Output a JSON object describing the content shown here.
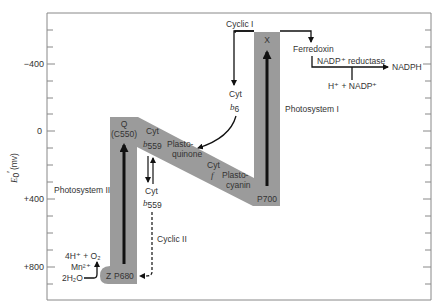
{
  "diagram": {
    "type": "Z-scheme of photosynthetic electron transport",
    "band_color": "#9b9b9b",
    "axis": {
      "label_main": "E",
      "label_sub": "0",
      "label_prime": "′",
      "label_unit": "(mv)",
      "ticks": [
        {
          "label": "−400",
          "value": -400
        },
        {
          "label": "0",
          "value": 0
        },
        {
          "label": "+400",
          "value": 400
        },
        {
          "label": "+800",
          "value": 800
        }
      ]
    },
    "labels": {
      "cyclic1": "Cyclic I",
      "x": "X",
      "ferredoxin": "Ferredoxin",
      "nadp_reductase": "NADP⁺ reductase",
      "nadph": "NADPH",
      "h_nadp": "H⁺ + NADP⁺",
      "cyt": "Cyt",
      "b6": "b",
      "b6_sub": "6",
      "photosystem1": "Photosystem I",
      "q": "Q",
      "c550": "(C550)",
      "cyt_b559_top": "Cyt",
      "b559": "b",
      "b559_sub": "559",
      "plasto_quinone_1": "Plasto-",
      "plasto_quinone_2": "quinone",
      "cyt_f_1": "Cyt",
      "cyt_f_2": "f",
      "plastocyanin_1": "Plasto-",
      "plastocyanin_2": "cyanin",
      "p700": "P700",
      "photosystem2": "Photosystem II",
      "cyt_lower": "Cyt",
      "cyclic2": "Cyclic II",
      "o2_line": "4H⁺ + O₂",
      "mn": "Mn²⁺",
      "water": "2H₂O",
      "z": "Z",
      "p680": "P680"
    }
  }
}
